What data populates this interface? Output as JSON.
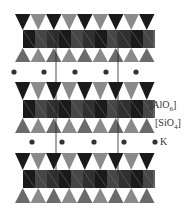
{
  "figure": {
    "type": "crystal-structure",
    "colors": {
      "aloct_dark": "#1a1a1a",
      "aloct_mid": "#555555",
      "sio4_dark": "#3a3a3a",
      "sio4_light": "#8a8a8a",
      "k_atom": "#333333",
      "cell_line": "#222222",
      "background": "#ffffff"
    },
    "layers": [
      {
        "name": "tot-layer-1",
        "top_tet_y": 14,
        "oct_y": 30,
        "bot_tet_y": 48,
        "bottom_y": 62
      },
      {
        "name": "tot-layer-2",
        "top_tet_y": 82,
        "oct_y": 100,
        "bot_tet_y": 118,
        "bottom_y": 133
      },
      {
        "name": "tot-layer-3",
        "top_tet_y": 153,
        "oct_y": 170,
        "bot_tet_y": 188,
        "bottom_y": 203
      }
    ],
    "k_rows": [
      {
        "y": 72,
        "x": [
          14,
          44,
          75,
          106,
          136
        ]
      },
      {
        "y": 142,
        "x": [
          32,
          62,
          94,
          124,
          155
        ]
      }
    ],
    "cell_lines_x": [
      56,
      118
    ],
    "legend": [
      {
        "key": "aloct",
        "base": "[AlO",
        "sub": "6",
        "close": "]"
      },
      {
        "key": "sio4",
        "base": "[SiO",
        "sub": "4",
        "close": "]"
      },
      {
        "key": "k",
        "text": "K"
      }
    ]
  }
}
